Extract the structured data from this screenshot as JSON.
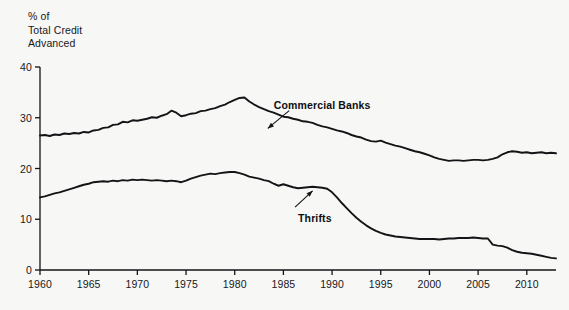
{
  "chart_data": {
    "type": "line",
    "title": "",
    "ylabel": "% of\nTotal Credit\nAdvanced",
    "xlabel": "",
    "ylim": [
      0,
      40
    ],
    "xlim": [
      1960,
      2013
    ],
    "yticks": [
      0,
      10,
      20,
      30,
      40
    ],
    "ytick_labels": [
      "0",
      "10",
      "20",
      "30",
      "40"
    ],
    "xticks": [
      1960,
      1965,
      1970,
      1975,
      1980,
      1985,
      1990,
      1995,
      2000,
      2005,
      2010
    ],
    "xtick_labels": [
      "1960",
      "1965",
      "1970",
      "1975",
      "1980",
      "1985",
      "1990",
      "1995",
      "2000",
      "2005",
      "2010"
    ],
    "grid": false,
    "legend": "annotations",
    "line_color": "#141417",
    "background_color": "#f7f7f6",
    "series": [
      {
        "name": "Commercial Banks",
        "label_x": 1984.0,
        "label_y": 32.6,
        "arrow_from": [
          1985.6,
          31.4
        ],
        "arrow_to": [
          1983.4,
          27.9
        ],
        "x": [
          1960.0,
          1960.5,
          1961.0,
          1961.5,
          1962.0,
          1962.5,
          1963.0,
          1963.5,
          1964.0,
          1964.5,
          1965.0,
          1965.5,
          1966.0,
          1966.5,
          1967.0,
          1967.5,
          1968.0,
          1968.5,
          1969.0,
          1969.5,
          1970.0,
          1970.5,
          1971.0,
          1971.5,
          1972.0,
          1972.5,
          1973.0,
          1973.5,
          1974.0,
          1974.5,
          1975.0,
          1975.5,
          1976.0,
          1976.5,
          1977.0,
          1977.5,
          1978.0,
          1978.5,
          1979.0,
          1979.5,
          1980.0,
          1980.5,
          1981.0,
          1981.5,
          1982.0,
          1982.5,
          1983.0,
          1983.5,
          1984.0,
          1984.5,
          1985.0,
          1985.5,
          1986.0,
          1986.5,
          1987.0,
          1987.5,
          1988.0,
          1988.5,
          1989.0,
          1989.5,
          1990.0,
          1990.5,
          1991.0,
          1991.5,
          1992.0,
          1992.5,
          1993.0,
          1993.5,
          1994.0,
          1994.5,
          1995.0,
          1995.5,
          1996.0,
          1996.5,
          1997.0,
          1997.5,
          1998.0,
          1998.5,
          1999.0,
          1999.5,
          2000.0,
          2000.5,
          2001.0,
          2001.5,
          2002.0,
          2002.5,
          2003.0,
          2003.5,
          2004.0,
          2004.5,
          2005.0,
          2005.5,
          2006.0,
          2006.5,
          2007.0,
          2007.5,
          2008.0,
          2008.5,
          2009.0,
          2009.5,
          2010.0,
          2010.5,
          2011.0,
          2011.5,
          2012.0,
          2012.5,
          2013.0
        ],
        "values": [
          26.5,
          26.6,
          26.4,
          26.7,
          26.6,
          26.9,
          26.8,
          27.0,
          26.9,
          27.2,
          27.1,
          27.5,
          27.6,
          28.0,
          28.1,
          28.6,
          28.7,
          29.2,
          29.1,
          29.5,
          29.4,
          29.6,
          29.8,
          30.1,
          30.0,
          30.4,
          30.7,
          31.4,
          31.0,
          30.3,
          30.5,
          30.8,
          30.9,
          31.3,
          31.4,
          31.7,
          31.9,
          32.3,
          32.6,
          33.1,
          33.5,
          33.9,
          34.0,
          33.2,
          32.6,
          32.1,
          31.7,
          31.3,
          31.0,
          30.6,
          30.2,
          30.1,
          29.8,
          29.6,
          29.3,
          29.2,
          29.0,
          28.6,
          28.3,
          28.1,
          27.8,
          27.5,
          27.3,
          27.0,
          26.6,
          26.3,
          26.1,
          25.7,
          25.4,
          25.3,
          25.5,
          25.1,
          24.8,
          24.5,
          24.3,
          24.0,
          23.7,
          23.4,
          23.2,
          22.9,
          22.6,
          22.2,
          21.9,
          21.7,
          21.5,
          21.6,
          21.6,
          21.5,
          21.6,
          21.7,
          21.7,
          21.6,
          21.7,
          21.9,
          22.2,
          22.8,
          23.2,
          23.4,
          23.3,
          23.1,
          23.2,
          23.0,
          23.1,
          23.2,
          23.0,
          23.1,
          23.0
        ]
      },
      {
        "name": "Thrifts",
        "label_x": 1986.5,
        "label_y": 10.3,
        "arrow_from": [
          1986.2,
          12.4
        ],
        "arrow_to": [
          1988.0,
          15.6
        ],
        "x": [
          1960.0,
          1960.5,
          1961.0,
          1961.5,
          1962.0,
          1962.5,
          1963.0,
          1963.5,
          1964.0,
          1964.5,
          1965.0,
          1965.5,
          1966.0,
          1966.5,
          1967.0,
          1967.5,
          1968.0,
          1968.5,
          1969.0,
          1969.5,
          1970.0,
          1970.5,
          1971.0,
          1971.5,
          1972.0,
          1972.5,
          1973.0,
          1973.5,
          1974.0,
          1974.5,
          1975.0,
          1975.5,
          1976.0,
          1976.5,
          1977.0,
          1977.5,
          1978.0,
          1978.5,
          1979.0,
          1979.5,
          1980.0,
          1980.5,
          1981.0,
          1981.5,
          1982.0,
          1982.5,
          1983.0,
          1983.5,
          1984.0,
          1984.5,
          1985.0,
          1985.5,
          1986.0,
          1986.5,
          1987.0,
          1987.5,
          1988.0,
          1988.5,
          1989.0,
          1989.5,
          1990.0,
          1990.5,
          1991.0,
          1991.5,
          1992.0,
          1992.5,
          1993.0,
          1993.5,
          1994.0,
          1994.5,
          1995.0,
          1995.5,
          1996.0,
          1996.5,
          1997.0,
          1997.5,
          1998.0,
          1998.5,
          1999.0,
          1999.5,
          2000.0,
          2000.5,
          2001.0,
          2001.5,
          2002.0,
          2002.5,
          2003.0,
          2003.5,
          2004.0,
          2004.5,
          2005.0,
          2005.5,
          2006.0,
          2006.5,
          2007.0,
          2007.5,
          2008.0,
          2008.5,
          2009.0,
          2009.5,
          2010.0,
          2010.5,
          2011.0,
          2011.5,
          2012.0,
          2012.5,
          2013.0
        ],
        "values": [
          14.3,
          14.5,
          14.8,
          15.1,
          15.3,
          15.6,
          15.9,
          16.2,
          16.5,
          16.8,
          17.0,
          17.3,
          17.4,
          17.5,
          17.4,
          17.6,
          17.5,
          17.7,
          17.6,
          17.8,
          17.7,
          17.8,
          17.7,
          17.6,
          17.7,
          17.6,
          17.5,
          17.6,
          17.5,
          17.3,
          17.6,
          18.0,
          18.3,
          18.6,
          18.8,
          19.0,
          18.9,
          19.1,
          19.2,
          19.3,
          19.3,
          19.1,
          18.8,
          18.4,
          18.2,
          18.0,
          17.7,
          17.5,
          17.0,
          16.6,
          16.9,
          16.6,
          16.3,
          16.1,
          16.2,
          16.3,
          16.4,
          16.3,
          16.2,
          16.0,
          15.3,
          14.3,
          13.2,
          12.2,
          11.2,
          10.3,
          9.5,
          8.8,
          8.2,
          7.7,
          7.3,
          7.0,
          6.8,
          6.6,
          6.5,
          6.4,
          6.3,
          6.2,
          6.1,
          6.1,
          6.1,
          6.1,
          6.0,
          6.1,
          6.2,
          6.2,
          6.3,
          6.3,
          6.3,
          6.4,
          6.3,
          6.2,
          6.2,
          5.0,
          4.8,
          4.7,
          4.4,
          3.9,
          3.6,
          3.4,
          3.3,
          3.2,
          3.0,
          2.8,
          2.6,
          2.4,
          2.3
        ]
      }
    ]
  }
}
